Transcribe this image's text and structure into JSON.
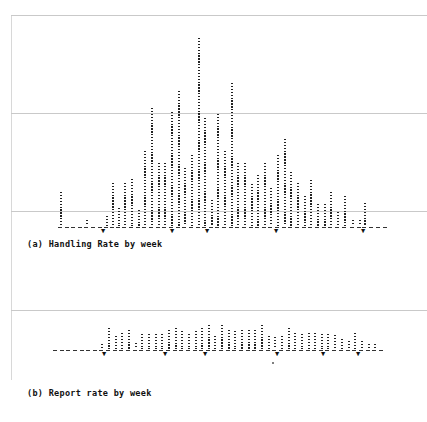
{
  "chart_data": [
    {
      "type": "bar",
      "title": "(a) Handling Rate by week",
      "xlabel": "week",
      "ylabel": "",
      "grid": true,
      "gridlines_px_above_baseline": [
        15,
        113,
        211
      ],
      "baseline_y": 226,
      "x_px": [
        60,
        67,
        73,
        80,
        86,
        93,
        100,
        106,
        112,
        118,
        124,
        131,
        138,
        144,
        151,
        158,
        164,
        171,
        178,
        184,
        191,
        198,
        204,
        211,
        217,
        224,
        231,
        237,
        244,
        251,
        257,
        264,
        270,
        277,
        284,
        290,
        297,
        304,
        310,
        317,
        324,
        330,
        337,
        344,
        352,
        359,
        364,
        371,
        378,
        385
      ],
      "values": [
        34,
        2,
        2,
        2,
        6,
        2,
        2,
        10,
        43,
        18,
        43,
        47,
        16,
        75,
        118,
        63,
        63,
        114,
        135,
        58,
        71,
        188,
        108,
        26,
        112,
        75,
        143,
        63,
        63,
        42,
        51,
        63,
        38,
        71,
        87,
        54,
        43,
        30,
        46,
        22,
        22,
        34,
        14,
        30,
        6,
        6,
        23,
        2,
        2,
        2
      ],
      "value_unit": "px height",
      "markers": [
        {
          "x": 104,
          "glyph": "▼"
        },
        {
          "x": 173,
          "glyph": "▼"
        },
        {
          "x": 208,
          "glyph": "▼"
        },
        {
          "x": 277,
          "glyph": "▼"
        },
        {
          "x": 364,
          "glyph": "▼"
        }
      ]
    },
    {
      "type": "bar",
      "title": "(b) Report rate by week",
      "xlabel": "week",
      "ylabel": "",
      "grid": true,
      "gridlines_px_above_baseline": [
        39
      ],
      "baseline_y": 349,
      "x_px": [
        55,
        62,
        68,
        75,
        82,
        88,
        95,
        101,
        108,
        115,
        121,
        128,
        135,
        141,
        148,
        155,
        161,
        168,
        175,
        181,
        188,
        195,
        201,
        208,
        214,
        221,
        228,
        234,
        241,
        248,
        254,
        261,
        268,
        274,
        281,
        288,
        294,
        301,
        308,
        314,
        321,
        327,
        334,
        341,
        348,
        354,
        361,
        368,
        374,
        381
      ],
      "values": [
        3,
        1,
        1,
        1,
        3,
        1,
        1,
        5,
        21,
        13,
        16,
        19,
        6,
        15,
        15,
        15,
        15,
        19,
        21,
        18,
        15,
        18,
        21,
        24,
        13,
        24,
        19,
        18,
        19,
        19,
        19,
        24,
        13,
        12,
        13,
        21,
        16,
        15,
        16,
        16,
        15,
        15,
        14,
        10,
        8,
        16,
        8,
        5,
        5,
        1
      ],
      "value_unit": "px height",
      "markers": [
        {
          "x": 105,
          "glyph": "▼"
        },
        {
          "x": 166,
          "glyph": "▼"
        },
        {
          "x": 206,
          "glyph": "▼"
        },
        {
          "x": 278,
          "glyph": "▼"
        },
        {
          "x": 324,
          "glyph": "▼"
        },
        {
          "x": 359,
          "glyph": "▼"
        }
      ]
    }
  ],
  "panel_a": {
    "caption": "(a) Handling Rate by week"
  },
  "panel_b": {
    "caption": "(b) Report rate by week"
  }
}
